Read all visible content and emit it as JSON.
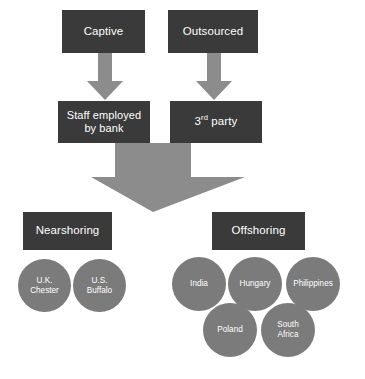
{
  "diagram": {
    "colors": {
      "box_fill": "#3a3a3a",
      "box_text": "#ffffff",
      "arrow_fill": "#8c8c8c",
      "circle_fill": "#7b7b7b",
      "circle_text": "#ffffff",
      "background": "#ffffff"
    },
    "level_1": {
      "captive": "Captive",
      "outsourced": "Outsourced"
    },
    "level_2": {
      "staff_employed_by_bank": "Staff employed by bank",
      "staff_employed_by_bank_line_1": "Staff employed",
      "staff_employed_by_bank_line_2": "by bank",
      "third_party_prefix": "3",
      "third_party_ordinal": "rd",
      "third_party_suffix": " party"
    },
    "level_3": {
      "nearshoring": "Nearshoring",
      "offshoring": "Offshoring"
    },
    "nearshoring_locations": [
      {
        "line_1": "U.K.",
        "line_2": "Chester"
      },
      {
        "line_1": "U.S.",
        "line_2": "Buffalo"
      }
    ],
    "offshoring_locations": [
      {
        "line_1": "India",
        "line_2": ""
      },
      {
        "line_1": "Hungary",
        "line_2": ""
      },
      {
        "line_1": "Philippines",
        "line_2": ""
      },
      {
        "line_1": "Poland",
        "line_2": ""
      },
      {
        "line_1": "South",
        "line_2": "Africa"
      }
    ],
    "arrows": [
      {
        "name": "captive-to-staff",
        "from": "Captive",
        "to": "Staff employed by bank",
        "direction": "down"
      },
      {
        "name": "outsourced-to-third-party",
        "from": "Outsourced",
        "to": "3rd party",
        "direction": "down"
      },
      {
        "name": "merge-to-shoring",
        "from": "Staff employed by bank / 3rd party",
        "to": "Nearshoring / Offshoring",
        "direction": "down"
      }
    ]
  }
}
